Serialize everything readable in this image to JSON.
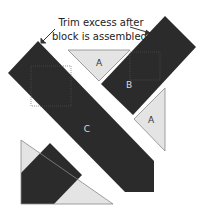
{
  "caption": {
    "line1": "Trim excess after",
    "line2": "block is assembled."
  },
  "pieces": {
    "a_top": {
      "label": "A"
    },
    "a_right": {
      "label": "A"
    },
    "b": {
      "label": "B"
    },
    "c": {
      "label": "C"
    }
  },
  "colors": {
    "dark": "#2b2b2b",
    "light": "#e4e4e4",
    "outline": "#888888",
    "label_on_dark": "#dddddd",
    "label_on_light": "#333333"
  }
}
